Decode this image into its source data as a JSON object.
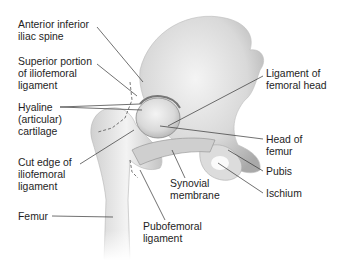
{
  "figure": {
    "labels": [
      {
        "id": "anterior-inferior-iliac-spine",
        "lines": [
          "Anterior inferior",
          "iliac spine"
        ],
        "x": 18,
        "y": 19
      },
      {
        "id": "superior-iliofemoral",
        "lines": [
          "Superior portion",
          "of iliofemoral",
          "ligament"
        ],
        "x": 18,
        "y": 56
      },
      {
        "id": "hyaline-cartilage",
        "lines": [
          "Hyaline",
          "(articular)",
          "cartilage"
        ],
        "x": 18,
        "y": 102
      },
      {
        "id": "cut-edge-iliofemoral",
        "lines": [
          "Cut edge of",
          "iliofemoral",
          "ligament"
        ],
        "x": 18,
        "y": 157
      },
      {
        "id": "femur",
        "lines": [
          "Femur"
        ],
        "x": 18,
        "y": 211
      },
      {
        "id": "pubofemoral-ligament",
        "lines": [
          "Pubofemoral",
          "ligament"
        ],
        "x": 143,
        "y": 221
      },
      {
        "id": "synovial-membrane",
        "lines": [
          "Synovial",
          "membrane"
        ],
        "x": 170,
        "y": 178
      },
      {
        "id": "ligament-femoral-head",
        "lines": [
          "Ligament of",
          "femoral head"
        ],
        "x": 266,
        "y": 68
      },
      {
        "id": "head-of-femur",
        "lines": [
          "Head of",
          "femur"
        ],
        "x": 266,
        "y": 134
      },
      {
        "id": "pubis",
        "lines": [
          "Pubis"
        ],
        "x": 266,
        "y": 166
      },
      {
        "id": "ischium",
        "lines": [
          "Ischium"
        ],
        "x": 266,
        "y": 188
      }
    ]
  }
}
